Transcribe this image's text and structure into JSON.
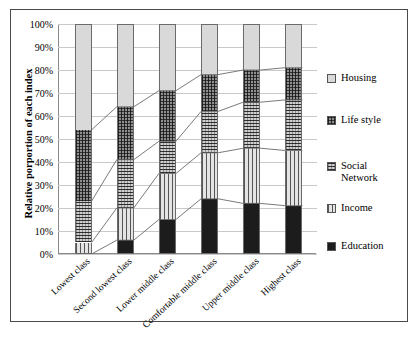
{
  "chart_data": {
    "type": "bar",
    "stacked": true,
    "stack_mode": "percent",
    "title": "",
    "subtitle": "",
    "xlabel": "",
    "ylabel": "Relative porportion of each index",
    "ylim": [
      0,
      100
    ],
    "yticks": [
      "0%",
      "10%",
      "20%",
      "30%",
      "40%",
      "50%",
      "60%",
      "70%",
      "80%",
      "90%",
      "100%"
    ],
    "ytick_values": [
      0,
      10,
      20,
      30,
      40,
      50,
      60,
      70,
      80,
      90,
      100
    ],
    "grid": true,
    "legend_position": "right",
    "categories": [
      "Lowest class",
      "Second lowest class",
      "Lower middle class",
      "Comfortable middle class",
      "Upper middle class",
      "Highest class"
    ],
    "series": [
      {
        "name": "Education",
        "pattern": "solid-dark",
        "color": "#1c1c1c",
        "values": [
          0,
          6,
          15,
          24,
          22,
          21
        ]
      },
      {
        "name": "Income",
        "pattern": "vertical-lines",
        "color": "#e4e4e4",
        "values": [
          5,
          14,
          20,
          20,
          24,
          24
        ]
      },
      {
        "name": "Social Network",
        "pattern": "horizontal-lines",
        "color": "#cfcfcf",
        "values": [
          18,
          21,
          14,
          18,
          20,
          22
        ]
      },
      {
        "name": "Life style",
        "pattern": "crosshatch-dark",
        "color": "#8f8f8f",
        "values": [
          31,
          23,
          22,
          16,
          14,
          14
        ]
      },
      {
        "name": "Housing",
        "pattern": "solid-light",
        "color": "#d9d9d9",
        "values": [
          46,
          36,
          29,
          22,
          20,
          19
        ]
      }
    ],
    "cumulative_tops": {
      "Education": [
        0,
        6,
        15,
        24,
        22,
        21
      ],
      "Income": [
        5,
        20,
        35,
        44,
        46,
        45
      ],
      "Social Network": [
        23,
        41,
        49,
        62,
        66,
        67
      ],
      "Life style": [
        54,
        64,
        71,
        78,
        80,
        81
      ],
      "Housing": [
        100,
        100,
        100,
        100,
        100,
        100
      ]
    },
    "annotations": [],
    "connector_lines": true
  },
  "legend": {
    "items": [
      {
        "label": "Housing",
        "swatch": "swatch-housing"
      },
      {
        "label": "Life style",
        "swatch": "swatch-lifestyle"
      },
      {
        "label": "Social\nNetwork",
        "swatch": "swatch-social"
      },
      {
        "label": "Income",
        "swatch": "swatch-income"
      },
      {
        "label": "Education",
        "swatch": "swatch-education"
      }
    ]
  }
}
